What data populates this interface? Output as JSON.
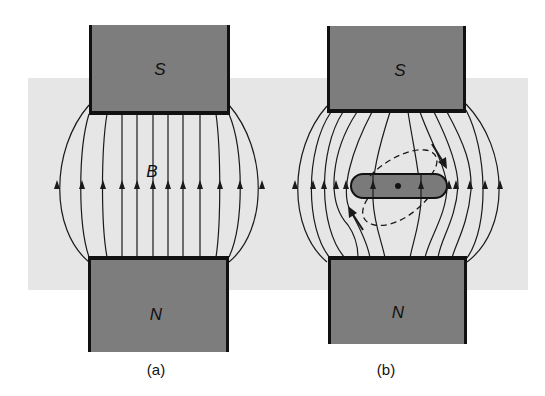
{
  "figure": {
    "colors": {
      "background": "#ffffff",
      "field_region": "#e6e6e6",
      "magnet_fill": "#7d7d7d",
      "magnet_edge": "#111111",
      "field_line": "#1a1a1a",
      "bar_fill": "#7a7a7a"
    },
    "panel_a": {
      "caption": "(a)",
      "top_magnet": {
        "label": "S"
      },
      "bottom_magnet": {
        "label": "N"
      },
      "field_label": "B",
      "field_line_count": 12,
      "field_direction": "upward (N to S)"
    },
    "panel_b": {
      "caption": "(b)",
      "top_magnet": {
        "label": "S"
      },
      "bottom_magnet": {
        "label": "N"
      },
      "field_line_count": 12,
      "object": "elongated bar with pivot dot at center",
      "current_loop": "dashed tilted loop with rotation arrows"
    }
  }
}
